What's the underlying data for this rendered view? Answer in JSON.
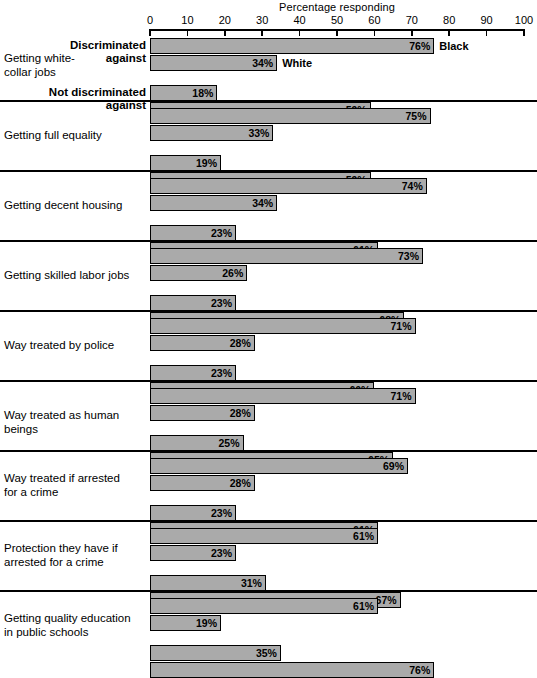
{
  "chart_data": {
    "type": "bar",
    "title": "Percentage responding",
    "xlabel": "Percentage responding",
    "ylabel": "",
    "orientation": "horizontal",
    "xlim": [
      0,
      100
    ],
    "xticks": [
      0,
      10,
      20,
      30,
      40,
      50,
      60,
      70,
      80,
      90,
      100
    ],
    "xticklabels": [
      "0",
      "10",
      "20",
      "30",
      "40",
      "50",
      "60",
      "70",
      "80",
      "90",
      "100"
    ],
    "grid": false,
    "legend": [
      "Black",
      "White"
    ],
    "legend_position": "inline-first-group",
    "bar_color": "#aaaaaa",
    "bar_edge_color": "#000000",
    "subgroups": [
      "Discriminated\nagainst",
      "Not discriminated\nagainst"
    ],
    "categories": [
      "Getting white-\ncollar jobs",
      "Getting full equality",
      "Getting decent housing",
      "Getting skilled labor jobs",
      "Way treated by police",
      "Way treated as human beings",
      "Way treated if arrested\nfor a crime",
      "Protection they have if\narrested for a crime",
      "Getting quality education\nin public schools"
    ],
    "series": [
      {
        "name": "Discriminated against - Black",
        "values": [
          76,
          75,
          74,
          73,
          71,
          71,
          69,
          61,
          61
        ],
        "labels": [
          "76%",
          "75%",
          "74%",
          "73%",
          "71%",
          "71%",
          "69%",
          "61%",
          "61%"
        ]
      },
      {
        "name": "Discriminated against - White",
        "values": [
          34,
          33,
          34,
          26,
          28,
          28,
          28,
          23,
          19
        ],
        "labels": [
          "34%",
          "33%",
          "34%",
          "26%",
          "28%",
          "28%",
          "28%",
          "23%",
          "19%"
        ]
      },
      {
        "name": "Not discriminated against - Black",
        "values": [
          18,
          19,
          23,
          23,
          23,
          25,
          23,
          31,
          35
        ],
        "labels": [
          "18%",
          "19%",
          "23%",
          "23%",
          "23%",
          "25%",
          "23%",
          "31%",
          "35%"
        ]
      },
      {
        "name": "Not discriminated against - White",
        "values": [
          59,
          59,
          61,
          68,
          60,
          65,
          61,
          67,
          76
        ],
        "labels": [
          "59%",
          "59%",
          "61%",
          "68%",
          "60%",
          "65%",
          "61%",
          "76%",
          "76%"
        ]
      }
    ]
  },
  "axis": {
    "title": "Percentage responding",
    "ticks": [
      "0",
      "10",
      "20",
      "30",
      "40",
      "50",
      "60",
      "70",
      "80",
      "90",
      "100"
    ]
  },
  "legend": {
    "black_label": "Black",
    "white_label": "White"
  },
  "subgroup_labels": {
    "discriminated": "Discriminated\nagainst",
    "not_discriminated": "Not discriminated\nagainst"
  },
  "groups": [
    {
      "category": "Getting white-\ncollar jobs",
      "bars": [
        {
          "value": 76,
          "label": "76%"
        },
        {
          "value": 34,
          "label": "34%"
        },
        {
          "value": 18,
          "label": "18%"
        },
        {
          "value": 59,
          "label": "59%"
        }
      ]
    },
    {
      "category": "Getting full equality",
      "bars": [
        {
          "value": 75,
          "label": "75%"
        },
        {
          "value": 33,
          "label": "33%"
        },
        {
          "value": 19,
          "label": "19%"
        },
        {
          "value": 59,
          "label": "59%"
        }
      ]
    },
    {
      "category": "Getting decent housing",
      "bars": [
        {
          "value": 74,
          "label": "74%"
        },
        {
          "value": 34,
          "label": "34%"
        },
        {
          "value": 23,
          "label": "23%"
        },
        {
          "value": 61,
          "label": "61%"
        }
      ]
    },
    {
      "category": "Getting skilled labor jobs",
      "bars": [
        {
          "value": 73,
          "label": "73%"
        },
        {
          "value": 26,
          "label": "26%"
        },
        {
          "value": 23,
          "label": "23%"
        },
        {
          "value": 68,
          "label": "68%"
        }
      ]
    },
    {
      "category": "Way treated by police",
      "bars": [
        {
          "value": 71,
          "label": "71%"
        },
        {
          "value": 28,
          "label": "28%"
        },
        {
          "value": 23,
          "label": "23%"
        },
        {
          "value": 60,
          "label": "60%"
        }
      ]
    },
    {
      "category": "Way treated as human beings",
      "bars": [
        {
          "value": 71,
          "label": "71%"
        },
        {
          "value": 28,
          "label": "28%"
        },
        {
          "value": 25,
          "label": "25%"
        },
        {
          "value": 65,
          "label": "65%"
        }
      ]
    },
    {
      "category": "Way treated if arrested\nfor a crime",
      "bars": [
        {
          "value": 69,
          "label": "69%"
        },
        {
          "value": 28,
          "label": "28%"
        },
        {
          "value": 23,
          "label": "23%"
        },
        {
          "value": 61,
          "label": "61%"
        }
      ]
    },
    {
      "category": "Protection they have if\narrested for a crime",
      "bars": [
        {
          "value": 61,
          "label": "61%"
        },
        {
          "value": 23,
          "label": "23%"
        },
        {
          "value": 31,
          "label": "31%"
        },
        {
          "value": 67,
          "label": "67%"
        }
      ]
    },
    {
      "category": "Getting quality education\nin public schools",
      "bars": [
        {
          "value": 61,
          "label": "61%"
        },
        {
          "value": 19,
          "label": "19%"
        },
        {
          "value": 35,
          "label": "35%"
        },
        {
          "value": 76,
          "label": "76%"
        }
      ]
    }
  ]
}
